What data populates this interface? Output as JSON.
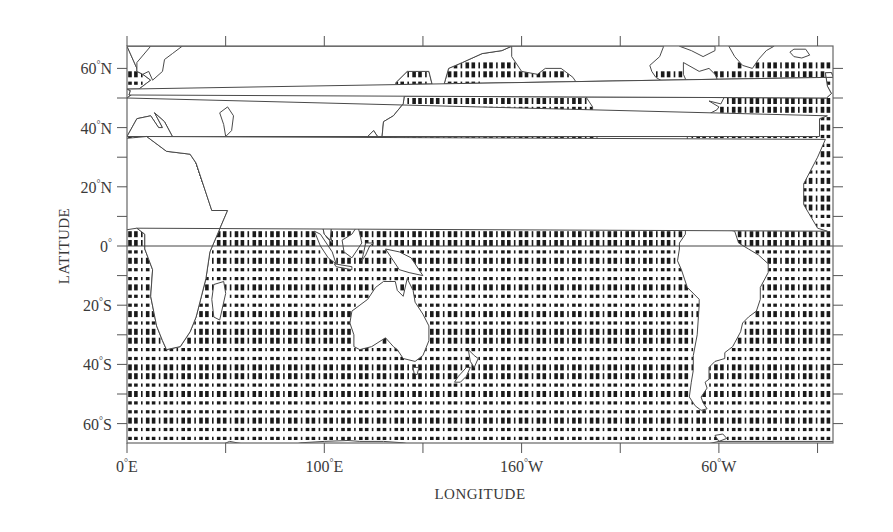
{
  "chart_data": {
    "type": "map",
    "title": "",
    "xlabel": "LONGITUDE",
    "ylabel": "LATITUDE",
    "projection": "equirectangular",
    "lon_range_east": [
      0,
      357.5
    ],
    "lat_range": [
      -66.5,
      67.5
    ],
    "x_ticks": [
      {
        "lon_east": 0,
        "label": "0",
        "suffix": "E"
      },
      {
        "lon_east": 50,
        "label": "",
        "suffix": ""
      },
      {
        "lon_east": 100,
        "label": "100",
        "suffix": "E"
      },
      {
        "lon_east": 150,
        "label": "",
        "suffix": ""
      },
      {
        "lon_east": 200,
        "label": "160",
        "suffix": "W"
      },
      {
        "lon_east": 250,
        "label": "",
        "suffix": ""
      },
      {
        "lon_east": 300,
        "label": "60",
        "suffix": "W"
      },
      {
        "lon_east": 350,
        "label": "",
        "suffix": ""
      }
    ],
    "y_ticks": [
      {
        "lat": 60,
        "label": "60",
        "suffix": "N"
      },
      {
        "lat": 50,
        "label": "",
        "suffix": ""
      },
      {
        "lat": 40,
        "label": "40",
        "suffix": "N"
      },
      {
        "lat": 30,
        "label": "",
        "suffix": ""
      },
      {
        "lat": 20,
        "label": "20",
        "suffix": "N"
      },
      {
        "lat": 10,
        "label": "",
        "suffix": ""
      },
      {
        "lat": 0,
        "label": "0",
        "suffix": ""
      },
      {
        "lat": -10,
        "label": "",
        "suffix": ""
      },
      {
        "lat": -20,
        "label": "20",
        "suffix": "S"
      },
      {
        "lat": -30,
        "label": "",
        "suffix": ""
      },
      {
        "lat": -40,
        "label": "40",
        "suffix": "S"
      },
      {
        "lat": -50,
        "label": "",
        "suffix": ""
      },
      {
        "lat": -60,
        "label": "60",
        "suffix": "S"
      }
    ],
    "equator_line": true,
    "grid": false,
    "data_description": "Ocean grid points marked with small rectangles (approx. 3 degree longitude x 3 degree latitude spacing) covering ocean areas between ~66S and ~62N; land areas blank with coastline outlines.",
    "marker": {
      "shape": "rectangle",
      "color": "#1a1a1a",
      "grid_dlon": 3,
      "grid_dlat": 3
    },
    "colors": {
      "coastline": "#4a4a4a",
      "frame": "#555555",
      "marker": "#1a1a1a",
      "background": "#ffffff"
    }
  },
  "labels": {
    "x_axis_title": "LONGITUDE",
    "y_axis_title": "LATITUDE",
    "degree_symbol": "°"
  }
}
